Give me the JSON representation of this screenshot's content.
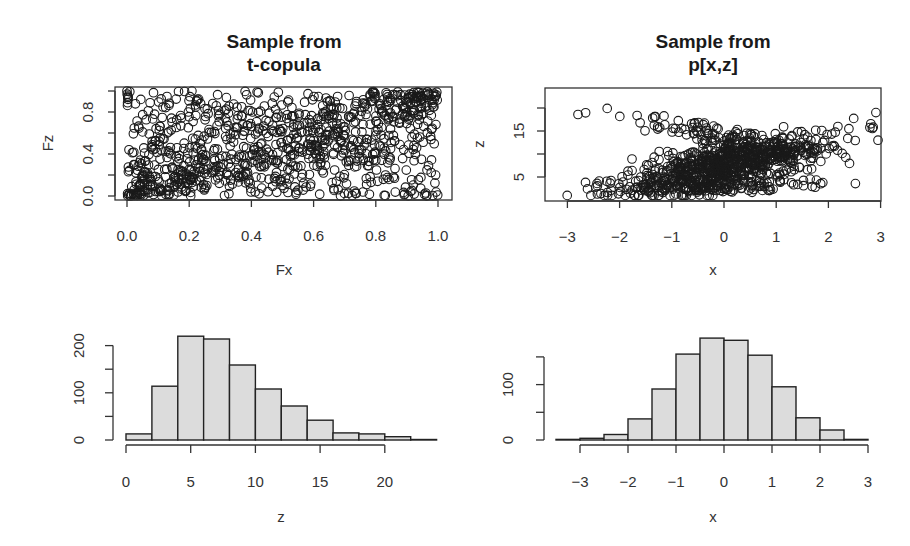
{
  "chart_data": [
    {
      "type": "scatter",
      "panel": "top-left",
      "title": "Sample from\nt-copula",
      "title_lines": [
        "Sample from",
        "t-copula"
      ],
      "xlabel": "Fx",
      "ylabel": "Fz",
      "xlim": [
        -0.04,
        1.04
      ],
      "ylim": [
        -0.04,
        1.04
      ],
      "xticks": [
        0.0,
        0.2,
        0.4,
        0.6,
        0.8,
        1.0
      ],
      "xtick_labels": [
        "0.0",
        "0.2",
        "0.4",
        "0.6",
        "0.8",
        "1.0"
      ],
      "yticks": [
        0.0,
        0.2,
        0.4,
        0.6,
        0.8,
        1.0
      ],
      "ytick_labels": [
        "0.0",
        "",
        "0.4",
        "",
        "0.8",
        ""
      ],
      "n_points": 1000,
      "description": "Uniform margins of a t-copula sample: dense positive diagonal band from (0,0) to (1,1) with tail-dependence crossing X pattern toward (0,1) and (1,0).",
      "grid": false,
      "marker": "open-circle"
    },
    {
      "type": "scatter",
      "panel": "top-right",
      "title": "Sample from\np[x,z]",
      "title_lines": [
        "Sample from",
        "p[x,z]"
      ],
      "xlabel": "x",
      "ylabel": "z",
      "xlim": [
        -3.25,
        3.2
      ],
      "ylim": [
        0.2,
        24.5
      ],
      "xticks": [
        -3,
        -2,
        -1,
        0,
        1,
        2,
        3
      ],
      "xtick_labels": [
        "-3",
        "-2",
        "-1",
        "0",
        "1",
        "2",
        "3"
      ],
      "yticks": [
        5,
        10,
        15,
        20
      ],
      "ytick_labels": [
        "5",
        "",
        "15",
        ""
      ],
      "n_points": 1000,
      "description": "x standard normal, z right-skewed (about 1 to 24); dense positively correlated cloud around x in [-1.5,1.5], z in [3,14], with sparse outliers forming a wedge toward low-x/high-z and high-x/low-z.",
      "grid": false,
      "marker": "open-circle"
    },
    {
      "type": "bar",
      "subtype": "histogram",
      "panel": "bottom-left",
      "title": "",
      "xlabel": "z",
      "ylabel": "",
      "bin_edges": [
        0,
        2,
        4,
        6,
        8,
        10,
        12,
        14,
        16,
        18,
        20,
        22,
        24
      ],
      "categories": [
        "0-2",
        "2-4",
        "4-6",
        "6-8",
        "8-10",
        "10-12",
        "12-14",
        "14-16",
        "16-18",
        "18-20",
        "20-22",
        "22-24"
      ],
      "values": [
        13,
        114,
        220,
        214,
        159,
        108,
        72,
        42,
        15,
        13,
        7,
        1
      ],
      "xticks": [
        0,
        5,
        10,
        15,
        20
      ],
      "xtick_labels": [
        "0",
        "5",
        "10",
        "15",
        "20"
      ],
      "yticks": [
        0,
        50,
        100,
        150,
        200
      ],
      "ytick_labels": [
        "0",
        "",
        "100",
        "",
        "200"
      ],
      "ylim": [
        0,
        225
      ],
      "bar_color": "#dcdcdc"
    },
    {
      "type": "bar",
      "subtype": "histogram",
      "panel": "bottom-right",
      "title": "",
      "xlabel": "x",
      "ylabel": "",
      "bin_edges": [
        -3.5,
        -3,
        -2.5,
        -2,
        -1.5,
        -1,
        -0.5,
        0,
        0.5,
        1,
        1.5,
        2,
        2.5,
        3
      ],
      "categories": [
        "-3.5--3",
        "-3--2.5",
        "-2.5--2",
        "-2--1.5",
        "-1.5--1",
        "-1--0.5",
        "-0.5-0",
        "0-0.5",
        "0.5-1",
        "1-1.5",
        "1.5-2",
        "2-2.5",
        "2.5-3"
      ],
      "values": [
        1,
        3,
        10,
        38,
        92,
        155,
        184,
        180,
        153,
        96,
        40,
        18,
        1
      ],
      "xticks": [
        -3,
        -2,
        -1,
        0,
        1,
        2,
        3
      ],
      "xtick_labels": [
        "-3",
        "-2",
        "-1",
        "0",
        "1",
        "2",
        "3"
      ],
      "yticks": [
        0,
        50,
        100,
        150
      ],
      "ytick_labels": [
        "0",
        "",
        "100",
        ""
      ],
      "ylim": [
        0,
        190
      ],
      "bar_color": "#dcdcdc"
    }
  ]
}
